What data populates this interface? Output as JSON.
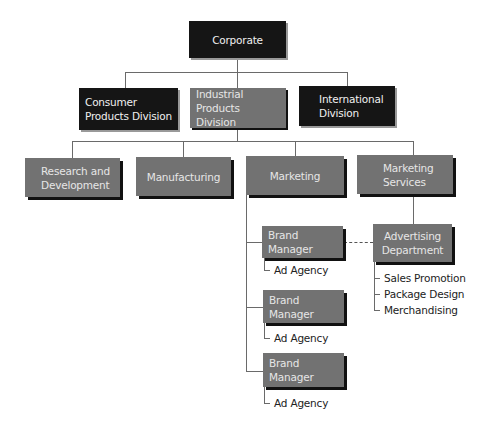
{
  "chart": {
    "root": {
      "label": "Corporate"
    },
    "divisions": [
      {
        "label": "Consumer Products Division",
        "style": "dark"
      },
      {
        "label": "Industrial Products Division",
        "style": "grey"
      },
      {
        "label": "International Division",
        "style": "dark"
      }
    ],
    "departments": [
      {
        "label": "Research and Development"
      },
      {
        "label": "Manufacturing"
      },
      {
        "label": "Marketing"
      },
      {
        "label": "Marketing Services"
      }
    ],
    "marketing": {
      "brand_managers": [
        {
          "label": "Brand Manager",
          "sub": "Ad Agency"
        },
        {
          "label": "Brand Manager",
          "sub": "Ad Agency"
        },
        {
          "label": "Brand Manager",
          "sub": "Ad Agency"
        }
      ]
    },
    "marketing_services": {
      "advertising": {
        "label": "Advertising Department"
      },
      "items": [
        "Sales Promotion",
        "Package Design",
        "Merchandising"
      ]
    }
  }
}
